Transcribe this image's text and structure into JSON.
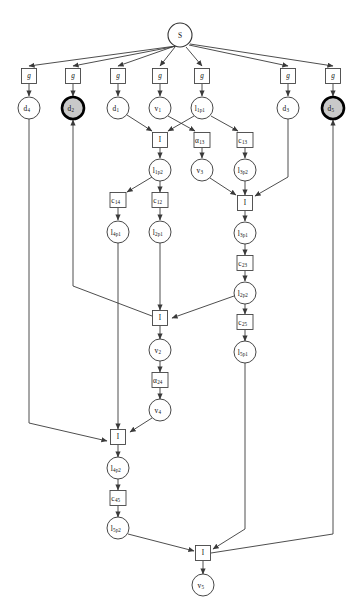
{
  "diagram": {
    "background_color": "#ffffff",
    "edge_color": "#3a3a3a",
    "goal_fill_color": "#c9c9c9",
    "node_fill_color": "#ffffff",
    "width": 362,
    "height": 611
  },
  "nodes": [
    {
      "id": "S",
      "label": "S",
      "sub": "",
      "shape": "circle",
      "style": "start",
      "x": 180,
      "y": 35,
      "r": 12
    },
    {
      "id": "g1",
      "label": "g",
      "sub": "",
      "shape": "rect",
      "style": "plain",
      "x": 29,
      "y": 76,
      "w": 15,
      "h": 15
    },
    {
      "id": "g2",
      "label": "g",
      "sub": "",
      "shape": "rect",
      "style": "plain",
      "x": 73,
      "y": 76,
      "w": 15,
      "h": 15
    },
    {
      "id": "g3",
      "label": "g",
      "sub": "",
      "shape": "rect",
      "style": "plain",
      "x": 118,
      "y": 76,
      "w": 15,
      "h": 15
    },
    {
      "id": "g4",
      "label": "g",
      "sub": "",
      "shape": "rect",
      "style": "plain",
      "x": 160,
      "y": 76,
      "w": 15,
      "h": 15
    },
    {
      "id": "g5",
      "label": "g",
      "sub": "",
      "shape": "rect",
      "style": "plain",
      "x": 202,
      "y": 76,
      "w": 15,
      "h": 15
    },
    {
      "id": "g6",
      "label": "g",
      "sub": "",
      "shape": "rect",
      "style": "plain",
      "x": 288,
      "y": 76,
      "w": 15,
      "h": 15
    },
    {
      "id": "g7",
      "label": "g",
      "sub": "",
      "shape": "rect",
      "style": "plain",
      "x": 333,
      "y": 76,
      "w": 15,
      "h": 15
    },
    {
      "id": "d4",
      "label": "d",
      "sub": "4",
      "shape": "circle",
      "style": "plain",
      "x": 29,
      "y": 108,
      "r": 11
    },
    {
      "id": "d2",
      "label": "d",
      "sub": "2",
      "shape": "circle",
      "style": "goal",
      "x": 73,
      "y": 108,
      "r": 11
    },
    {
      "id": "d1",
      "label": "d",
      "sub": "1",
      "shape": "circle",
      "style": "plain",
      "x": 118,
      "y": 108,
      "r": 11
    },
    {
      "id": "v1",
      "label": "v",
      "sub": "1",
      "shape": "circle",
      "style": "plain",
      "x": 160,
      "y": 108,
      "r": 11
    },
    {
      "id": "l1p1",
      "label": "l",
      "sub": "1p1",
      "shape": "circle",
      "style": "plain",
      "x": 202,
      "y": 108,
      "r": 11
    },
    {
      "id": "d3",
      "label": "d",
      "sub": "3",
      "shape": "circle",
      "style": "plain",
      "x": 288,
      "y": 108,
      "r": 11
    },
    {
      "id": "d5",
      "label": "d",
      "sub": "5",
      "shape": "circle",
      "style": "goal",
      "x": 333,
      "y": 108,
      "r": 11
    },
    {
      "id": "I1",
      "label": "I",
      "sub": "",
      "shape": "rect",
      "style": "plain",
      "x": 160,
      "y": 140,
      "w": 15,
      "h": 15
    },
    {
      "id": "a13",
      "label": "α",
      "sub": "13",
      "shape": "rect",
      "style": "plain",
      "x": 202,
      "y": 140,
      "w": 16,
      "h": 15
    },
    {
      "id": "c13",
      "label": "c",
      "sub": "13",
      "shape": "rect",
      "style": "plain",
      "x": 245,
      "y": 140,
      "w": 16,
      "h": 15
    },
    {
      "id": "l1p2",
      "label": "l",
      "sub": "1p2",
      "shape": "circle",
      "style": "plain",
      "x": 160,
      "y": 170,
      "r": 11
    },
    {
      "id": "v3",
      "label": "v",
      "sub": "3",
      "shape": "circle",
      "style": "plain",
      "x": 202,
      "y": 170,
      "r": 11
    },
    {
      "id": "l3p2",
      "label": "l",
      "sub": "3p2",
      "shape": "circle",
      "style": "plain",
      "x": 245,
      "y": 170,
      "r": 11
    },
    {
      "id": "c14",
      "label": "c",
      "sub": "14",
      "shape": "rect",
      "style": "plain",
      "x": 118,
      "y": 200,
      "w": 16,
      "h": 15
    },
    {
      "id": "c12",
      "label": "c",
      "sub": "12",
      "shape": "rect",
      "style": "plain",
      "x": 160,
      "y": 200,
      "w": 16,
      "h": 15
    },
    {
      "id": "I2",
      "label": "I",
      "sub": "",
      "shape": "rect",
      "style": "plain",
      "x": 245,
      "y": 203,
      "w": 15,
      "h": 15
    },
    {
      "id": "l4p1",
      "label": "l",
      "sub": "4p1",
      "shape": "circle",
      "style": "plain",
      "x": 118,
      "y": 232,
      "r": 11
    },
    {
      "id": "l2p1",
      "label": "l",
      "sub": "2p1",
      "shape": "circle",
      "style": "plain",
      "x": 160,
      "y": 232,
      "r": 11
    },
    {
      "id": "l3p1",
      "label": "l",
      "sub": "3p1",
      "shape": "circle",
      "style": "plain",
      "x": 245,
      "y": 233,
      "r": 11
    },
    {
      "id": "c23",
      "label": "c",
      "sub": "23",
      "shape": "rect",
      "style": "plain",
      "x": 245,
      "y": 263,
      "w": 16,
      "h": 15
    },
    {
      "id": "l2p2",
      "label": "l",
      "sub": "2p2",
      "shape": "circle",
      "style": "plain",
      "x": 245,
      "y": 293,
      "r": 11
    },
    {
      "id": "I3",
      "label": "I",
      "sub": "",
      "shape": "rect",
      "style": "plain",
      "x": 160,
      "y": 318,
      "w": 15,
      "h": 15
    },
    {
      "id": "c25",
      "label": "c",
      "sub": "25",
      "shape": "rect",
      "style": "plain",
      "x": 245,
      "y": 322,
      "w": 16,
      "h": 15
    },
    {
      "id": "v2",
      "label": "v",
      "sub": "2",
      "shape": "circle",
      "style": "plain",
      "x": 160,
      "y": 350,
      "r": 11
    },
    {
      "id": "l5p1",
      "label": "l",
      "sub": "5p1",
      "shape": "circle",
      "style": "plain",
      "x": 245,
      "y": 352,
      "r": 11
    },
    {
      "id": "a24",
      "label": "α",
      "sub": "24",
      "shape": "rect",
      "style": "plain",
      "x": 160,
      "y": 380,
      "w": 16,
      "h": 15
    },
    {
      "id": "v4",
      "label": "v",
      "sub": "4",
      "shape": "circle",
      "style": "plain",
      "x": 160,
      "y": 410,
      "r": 11
    },
    {
      "id": "I4",
      "label": "I",
      "sub": "",
      "shape": "rect",
      "style": "plain",
      "x": 118,
      "y": 437,
      "w": 15,
      "h": 15
    },
    {
      "id": "l4p2",
      "label": "l",
      "sub": "4p2",
      "shape": "circle",
      "style": "plain",
      "x": 118,
      "y": 468,
      "r": 11
    },
    {
      "id": "c45",
      "label": "c",
      "sub": "45",
      "shape": "rect",
      "style": "plain",
      "x": 118,
      "y": 498,
      "w": 16,
      "h": 15
    },
    {
      "id": "l5p2",
      "label": "l",
      "sub": "5p2",
      "shape": "circle",
      "style": "plain",
      "x": 118,
      "y": 528,
      "r": 11
    },
    {
      "id": "I5",
      "label": "I",
      "sub": "",
      "shape": "rect",
      "style": "plain",
      "x": 203,
      "y": 553,
      "w": 15,
      "h": 15
    },
    {
      "id": "v5",
      "label": "v",
      "sub": "5",
      "shape": "circle",
      "style": "plain",
      "x": 203,
      "y": 585,
      "r": 11
    }
  ],
  "edges": [
    {
      "from": "S",
      "to": "g1",
      "path": "M 176,46 L 29,66",
      "arrow": true
    },
    {
      "from": "S",
      "to": "g2",
      "path": "M 177,46 L 73,66",
      "arrow": true
    },
    {
      "from": "S",
      "to": "g3",
      "path": "M 175,46 L 118,66",
      "arrow": true
    },
    {
      "from": "S",
      "to": "g4",
      "path": "M 175,47 L 160,66",
      "arrow": true
    },
    {
      "from": "S",
      "to": "g5",
      "path": "M 186,47 L 202,66",
      "arrow": true
    },
    {
      "from": "S",
      "to": "g6",
      "path": "M 189,45 L 288,66",
      "arrow": true
    },
    {
      "from": "S",
      "to": "g7",
      "path": "M 190,44 L 333,66",
      "arrow": true
    },
    {
      "from": "g1",
      "to": "d4",
      "path": "M 29,84 L 29,96",
      "arrow": true
    },
    {
      "from": "g2",
      "to": "d2",
      "path": "M 73,84 L 73,96",
      "arrow": true
    },
    {
      "from": "g3",
      "to": "d1",
      "path": "M 118,84 L 118,96",
      "arrow": true
    },
    {
      "from": "g4",
      "to": "v1",
      "path": "M 160,84 L 160,96",
      "arrow": true
    },
    {
      "from": "g5",
      "to": "l1p1",
      "path": "M 202,84 L 202,96",
      "arrow": true
    },
    {
      "from": "g6",
      "to": "d3",
      "path": "M 288,84 L 288,96",
      "arrow": true
    },
    {
      "from": "g7",
      "to": "d5",
      "path": "M 333,84 L 333,96",
      "arrow": true
    },
    {
      "from": "d1",
      "to": "I1",
      "path": "M 127,115 L 152,131",
      "arrow": true
    },
    {
      "from": "v1",
      "to": "a13",
      "path": "M 168,116 L 195,131",
      "arrow": true
    },
    {
      "from": "l1p1",
      "to": "I1",
      "path": "M 194,116 L 168,131",
      "arrow": true
    },
    {
      "from": "l1p1",
      "to": "c13",
      "path": "M 211,116 L 238,131",
      "arrow": true
    },
    {
      "from": "I1",
      "to": "l1p2",
      "path": "M 160,148 L 160,158",
      "arrow": true
    },
    {
      "from": "a13",
      "to": "v3",
      "path": "M 202,148 L 202,158",
      "arrow": true
    },
    {
      "from": "c13",
      "to": "l3p2",
      "path": "M 245,148 L 245,158",
      "arrow": true
    },
    {
      "from": "l1p2",
      "to": "c14",
      "path": "M 152,177 L 127,192",
      "arrow": true
    },
    {
      "from": "l1p2",
      "to": "c12",
      "path": "M 160,181 L 160,192",
      "arrow": true
    },
    {
      "from": "c14",
      "to": "l4p1",
      "path": "M 118,208 L 118,220",
      "arrow": true
    },
    {
      "from": "c12",
      "to": "l2p1",
      "path": "M 160,208 L 160,220",
      "arrow": true
    },
    {
      "from": "v3",
      "to": "I2",
      "path": "M 210,178 L 236,195",
      "arrow": true
    },
    {
      "from": "l3p2",
      "to": "I2",
      "path": "M 245,181 L 245,195",
      "arrow": true
    },
    {
      "from": "d3",
      "to": "I2",
      "path": "M 288,119 L 288,177 L 255,196",
      "arrow": true
    },
    {
      "from": "I2",
      "to": "l3p1",
      "path": "M 245,211 L 245,221",
      "arrow": true
    },
    {
      "from": "l3p1",
      "to": "c23",
      "path": "M 245,244 L 245,255",
      "arrow": true
    },
    {
      "from": "c23",
      "to": "l2p2",
      "path": "M 245,271 L 245,281",
      "arrow": true
    },
    {
      "from": "l2p2",
      "to": "I3",
      "path": "M 234,296 L 172,318",
      "arrow": true
    },
    {
      "from": "l2p1",
      "to": "I3",
      "path": "M 160,243 L 160,310",
      "arrow": true
    },
    {
      "from": "I3",
      "to": "d2",
      "path": "M 152,316 L 73,286 L 73,120",
      "arrow": true
    },
    {
      "from": "I3",
      "to": "v2",
      "path": "M 160,326 L 160,339",
      "arrow": true
    },
    {
      "from": "v2",
      "to": "a24",
      "path": "M 160,361 L 160,372",
      "arrow": true
    },
    {
      "from": "a24",
      "to": "v4",
      "path": "M 160,388 L 160,399",
      "arrow": true
    },
    {
      "from": "l2p2",
      "to": "c25",
      "path": "M 245,304 L 245,314",
      "arrow": true
    },
    {
      "from": "c25",
      "to": "l5p1",
      "path": "M 245,330 L 245,341",
      "arrow": true
    },
    {
      "from": "v4",
      "to": "I4",
      "path": "M 152,418 L 130,432",
      "arrow": true
    },
    {
      "from": "l4p1",
      "to": "I4",
      "path": "M 118,243 L 118,429",
      "arrow": true
    },
    {
      "from": "d4",
      "to": "I4",
      "path": "M 29,119 L 29,423 L 107,441",
      "arrow": true
    },
    {
      "from": "I4",
      "to": "l4p2",
      "path": "M 118,445 L 118,457",
      "arrow": true
    },
    {
      "from": "l4p2",
      "to": "c45",
      "path": "M 118,479 L 118,490",
      "arrow": true
    },
    {
      "from": "c45",
      "to": "l5p2",
      "path": "M 118,506 L 118,517",
      "arrow": true
    },
    {
      "from": "l5p2",
      "to": "I5",
      "path": "M 128,534 L 194,551",
      "arrow": true
    },
    {
      "from": "l5p1",
      "to": "I5",
      "path": "M 245,363 L 245,529 L 213,549",
      "arrow": true
    },
    {
      "from": "I5",
      "to": "v5",
      "path": "M 203,561 L 203,574",
      "arrow": true
    },
    {
      "from": "I5",
      "to": "d5",
      "path": "M 211,553 L 333,534 L 333,120",
      "arrow": true
    }
  ]
}
